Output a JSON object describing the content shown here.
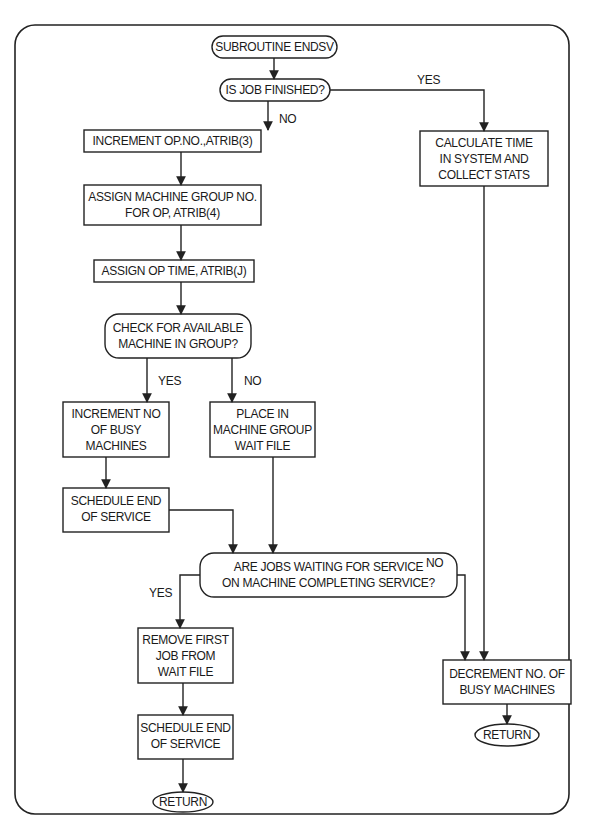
{
  "diagram": {
    "type": "flowchart",
    "title": "SUBROUTINE ENDSV",
    "nodes": {
      "start": {
        "text": "SUBROUTINE ENDSV",
        "shape": "terminal"
      },
      "q_finished": {
        "text": "IS JOB FINISHED?",
        "shape": "decision"
      },
      "increment_op": {
        "text": "INCREMENT OP.NO.,ATRIB(3)",
        "shape": "process"
      },
      "assign_group": {
        "line1": "ASSIGN MACHINE GROUP NO.",
        "line2": "FOR OP, ATRIB(4)",
        "shape": "process"
      },
      "assign_time": {
        "text": "ASSIGN OP TIME, ATRIB(J)",
        "shape": "process"
      },
      "q_available": {
        "line1": "CHECK FOR AVAILABLE",
        "line2": "MACHINE IN GROUP?",
        "shape": "decision"
      },
      "increment_busy": {
        "line1": "INCREMENT NO",
        "line2": "OF BUSY",
        "line3": "MACHINES",
        "shape": "process"
      },
      "place_wait": {
        "line1": "PLACE IN",
        "line2": "MACHINE GROUP",
        "line3": "WAIT FILE",
        "shape": "process"
      },
      "schedule_end_1": {
        "line1": "SCHEDULE END",
        "line2": "OF SERVICE",
        "shape": "process"
      },
      "q_waiting": {
        "line1": "ARE JOBS WAITING FOR SERVICE",
        "line2": "ON MACHINE COMPLETING SERVICE?",
        "shape": "decision"
      },
      "remove_first": {
        "line1": "REMOVE FIRST",
        "line2": "JOB FROM",
        "line3": "WAIT FILE",
        "shape": "process"
      },
      "schedule_end_2": {
        "line1": "SCHEDULE END",
        "line2": "OF SERVICE",
        "shape": "process"
      },
      "return_1": {
        "text": "RETURN",
        "shape": "terminal"
      },
      "calc_time": {
        "line1": "CALCULATE TIME",
        "line2": "IN SYSTEM AND",
        "line3": "COLLECT STATS",
        "shape": "process"
      },
      "decrement_busy": {
        "line1": "DECREMENT NO. OF",
        "line2": "BUSY MACHINES",
        "shape": "process"
      },
      "return_2": {
        "text": "RETURN",
        "shape": "terminal"
      }
    },
    "edge_labels": {
      "finished_yes": "YES",
      "finished_no": "NO",
      "available_yes": "YES",
      "available_no": "NO",
      "waiting_yes": "YES",
      "waiting_no": "NO"
    },
    "edges": [
      {
        "from": "start",
        "to": "q_finished"
      },
      {
        "from": "q_finished",
        "to": "calc_time",
        "label": "YES"
      },
      {
        "from": "q_finished",
        "to": "increment_op",
        "label": "NO"
      },
      {
        "from": "increment_op",
        "to": "assign_group"
      },
      {
        "from": "assign_group",
        "to": "assign_time"
      },
      {
        "from": "assign_time",
        "to": "q_available"
      },
      {
        "from": "q_available",
        "to": "increment_busy",
        "label": "YES"
      },
      {
        "from": "q_available",
        "to": "place_wait",
        "label": "NO"
      },
      {
        "from": "increment_busy",
        "to": "schedule_end_1"
      },
      {
        "from": "schedule_end_1",
        "to": "q_waiting"
      },
      {
        "from": "place_wait",
        "to": "q_waiting"
      },
      {
        "from": "q_waiting",
        "to": "remove_first",
        "label": "YES"
      },
      {
        "from": "q_waiting",
        "to": "decrement_busy",
        "label": "NO"
      },
      {
        "from": "remove_first",
        "to": "schedule_end_2"
      },
      {
        "from": "schedule_end_2",
        "to": "return_1"
      },
      {
        "from": "calc_time",
        "to": "decrement_busy"
      },
      {
        "from": "decrement_busy",
        "to": "return_2"
      }
    ]
  }
}
